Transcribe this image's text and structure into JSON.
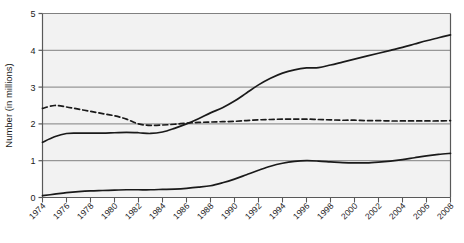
{
  "chart_data": {
    "type": "line",
    "title": "",
    "xlabel": "",
    "ylabel": "Number (in millions)",
    "ylim": [
      0,
      5
    ],
    "xlim": [
      1974,
      2008
    ],
    "ytick_labels": [
      "0",
      "1",
      "2",
      "3",
      "4",
      "5"
    ],
    "yticks": [
      0,
      1,
      2,
      3,
      4,
      5
    ],
    "grid": true,
    "grid_axis": "y",
    "legend": "none",
    "xtick_labels": [
      "1974",
      "1976",
      "1978",
      "1980",
      "1982",
      "1984",
      "1986",
      "1988",
      "1990",
      "1992",
      "1994",
      "1996",
      "1998",
      "2000",
      "2002",
      "2004",
      "2006",
      "2008"
    ],
    "xticks": [
      1974,
      1976,
      1978,
      1980,
      1982,
      1984,
      1986,
      1988,
      1990,
      1992,
      1994,
      1996,
      1998,
      2000,
      2002,
      2004,
      2006,
      2008
    ],
    "x": [
      1974,
      1975,
      1976,
      1977,
      1978,
      1979,
      1980,
      1981,
      1982,
      1983,
      1984,
      1985,
      1986,
      1987,
      1988,
      1989,
      1990,
      1991,
      1992,
      1993,
      1994,
      1995,
      1996,
      1997,
      1998,
      1999,
      2000,
      2001,
      2002,
      2003,
      2004,
      2005,
      2006,
      2007,
      2008
    ],
    "series": [
      {
        "name": "upper-solid-series",
        "style": "solid",
        "color": "#1a1a1a",
        "values": [
          1.5,
          1.65,
          1.74,
          1.75,
          1.75,
          1.75,
          1.76,
          1.77,
          1.76,
          1.74,
          1.78,
          1.88,
          2.0,
          2.14,
          2.3,
          2.44,
          2.62,
          2.84,
          3.06,
          3.24,
          3.38,
          3.47,
          3.52,
          3.53,
          3.6,
          3.68,
          3.76,
          3.84,
          3.92,
          4.0,
          4.08,
          4.17,
          4.26,
          4.34,
          4.42
        ]
      },
      {
        "name": "dashed-series",
        "style": "dashed",
        "color": "#1a1a1a",
        "values": [
          2.42,
          2.5,
          2.46,
          2.4,
          2.34,
          2.28,
          2.22,
          2.13,
          2.0,
          1.96,
          1.97,
          1.99,
          2.02,
          2.04,
          2.05,
          2.06,
          2.07,
          2.09,
          2.11,
          2.12,
          2.13,
          2.13,
          2.13,
          2.12,
          2.11,
          2.1,
          2.1,
          2.09,
          2.09,
          2.08,
          2.08,
          2.08,
          2.08,
          2.08,
          2.09
        ]
      },
      {
        "name": "lower-solid-series",
        "style": "solid",
        "color": "#1a1a1a",
        "values": [
          0.05,
          0.09,
          0.13,
          0.16,
          0.18,
          0.19,
          0.2,
          0.21,
          0.21,
          0.21,
          0.22,
          0.23,
          0.25,
          0.28,
          0.32,
          0.4,
          0.5,
          0.62,
          0.74,
          0.85,
          0.93,
          0.98,
          1.0,
          0.99,
          0.97,
          0.95,
          0.94,
          0.94,
          0.96,
          0.99,
          1.03,
          1.08,
          1.13,
          1.17,
          1.2
        ]
      }
    ]
  },
  "colors": {
    "plot_background": "#f2f2f2",
    "gridline": "#808080",
    "axis": "#595959",
    "line": "#1a1a1a",
    "text": "#1a1a1a"
  }
}
